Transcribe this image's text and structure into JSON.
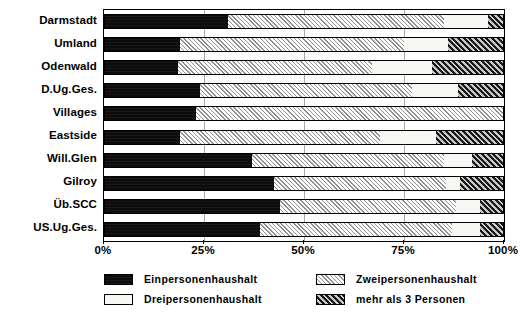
{
  "chart_data": {
    "type": "bar",
    "orientation": "horizontal",
    "stacked": true,
    "normalized": true,
    "title": "",
    "subtitle": "",
    "xlabel": "",
    "ylabel": "",
    "xlim": [
      0,
      100
    ],
    "grid": true,
    "grid_axis": "x",
    "legend_position": "bottom",
    "x_ticks": [
      0,
      25,
      50,
      75,
      100
    ],
    "x_tick_labels": [
      "0%",
      "25%",
      "50%",
      "75%",
      "100%"
    ],
    "categories": [
      "Darmstadt",
      "Umland",
      "Odenwald",
      "D.Ug.Ges.",
      "Villages",
      "Eastside",
      "Will.Glen",
      "Gilroy",
      "Üb.SCC",
      "US.Ug.Ges."
    ],
    "series": [
      {
        "name": "Einpersonenhaushalt",
        "pattern": "solid-black",
        "color": "#0c0c0c",
        "values": [
          31,
          19,
          18.5,
          24,
          23,
          19,
          37,
          42.5,
          44,
          39
        ]
      },
      {
        "name": "Zweipersonenhaushalt",
        "pattern": "light-grey-hatch",
        "color": "#8f8f8f",
        "values": [
          54,
          56,
          48.5,
          53,
          77,
          50,
          48,
          43,
          44,
          48
        ]
      },
      {
        "name": "Dreipersonenhaushalt",
        "pattern": "white",
        "color": "#f7f7f4",
        "values": [
          11,
          11,
          15,
          11.5,
          0,
          14,
          7,
          3.5,
          6,
          7
        ]
      },
      {
        "name": "mehr als 3 Personen",
        "pattern": "dark-grey-hatch",
        "color": "#5a5a5a",
        "values": [
          4,
          14,
          18,
          11.5,
          0,
          17,
          8,
          11,
          6,
          6
        ]
      }
    ]
  },
  "legend": {
    "items": [
      {
        "label": "Einpersonenhaushalt",
        "swatch": "solid-black"
      },
      {
        "label": "Zweipersonenhaushalt",
        "swatch": "light-grey-hatch"
      },
      {
        "label": "Dreipersonenhaushalt",
        "swatch": "white"
      },
      {
        "label": "mehr als 3 Personen",
        "swatch": "dark-grey-hatch"
      }
    ]
  }
}
